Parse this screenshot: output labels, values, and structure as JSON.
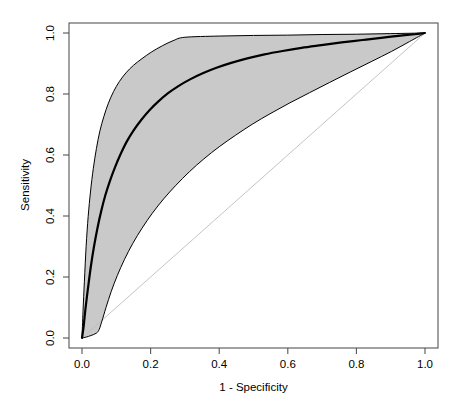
{
  "figure": {
    "kind": "roc-curve-plot",
    "width": 463,
    "height": 410,
    "background_color": "#ffffff"
  },
  "chart_data": {
    "type": "line",
    "title": "",
    "xlabel": "1 - Specificity",
    "ylabel": "Sensitivity",
    "xlim": [
      0.0,
      1.0
    ],
    "ylim": [
      0.0,
      1.0
    ],
    "grid": false,
    "legend": null,
    "xticks": [
      0.0,
      0.2,
      0.4,
      0.6,
      0.8,
      1.0
    ],
    "xtick_labels": [
      "0.0",
      "0.2",
      "0.4",
      "0.6",
      "0.8",
      "1.0"
    ],
    "yticks": [
      0.0,
      0.2,
      0.4,
      0.6,
      0.8,
      1.0
    ],
    "ytick_labels": [
      "0.0",
      "0.2",
      "0.4",
      "0.6",
      "0.8",
      "1.0"
    ],
    "series": [
      {
        "name": "mean-roc-curve",
        "style": "solid",
        "color": "#000000",
        "line_width": 2.2,
        "x": [
          0.0,
          0.005,
          0.01,
          0.018,
          0.026,
          0.035,
          0.045,
          0.056,
          0.068,
          0.082,
          0.097,
          0.113,
          0.13,
          0.15,
          0.172,
          0.196,
          0.222,
          0.25,
          0.281,
          0.315,
          0.352,
          0.392,
          0.435,
          0.482,
          0.532,
          0.585,
          0.64,
          0.698,
          0.757,
          0.818,
          0.878,
          0.935,
          0.97,
          1.0
        ],
        "y": [
          0.0,
          0.04,
          0.095,
          0.168,
          0.236,
          0.3,
          0.36,
          0.416,
          0.468,
          0.517,
          0.562,
          0.604,
          0.643,
          0.68,
          0.714,
          0.746,
          0.775,
          0.802,
          0.826,
          0.848,
          0.868,
          0.886,
          0.902,
          0.917,
          0.93,
          0.941,
          0.951,
          0.96,
          0.969,
          0.977,
          0.985,
          0.992,
          0.996,
          1.0
        ]
      },
      {
        "name": "upper-confidence-bound",
        "style": "solid",
        "color": "#000000",
        "line_width": 1.0,
        "x": [
          0.0,
          0.003,
          0.007,
          0.012,
          0.018,
          0.025,
          0.033,
          0.042,
          0.052,
          0.064,
          0.077,
          0.092,
          0.109,
          0.128,
          0.15,
          0.175,
          0.203,
          0.234,
          0.268,
          0.3,
          0.4,
          0.5,
          0.6,
          0.7,
          0.8,
          0.9,
          1.0
        ],
        "y": [
          0.0,
          0.088,
          0.186,
          0.3,
          0.398,
          0.482,
          0.556,
          0.621,
          0.678,
          0.727,
          0.77,
          0.808,
          0.841,
          0.869,
          0.894,
          0.916,
          0.938,
          0.958,
          0.976,
          0.986,
          0.99,
          0.992,
          0.993,
          0.995,
          0.996,
          0.998,
          1.0
        ]
      },
      {
        "name": "lower-confidence-bound",
        "style": "solid",
        "color": "#000000",
        "line_width": 1.0,
        "x": [
          0.0,
          0.012,
          0.026,
          0.042,
          0.05,
          0.058,
          0.07,
          0.085,
          0.103,
          0.124,
          0.148,
          0.175,
          0.205,
          0.238,
          0.274,
          0.313,
          0.355,
          0.4,
          0.448,
          0.498,
          0.551,
          0.606,
          0.663,
          0.722,
          0.782,
          0.843,
          0.903,
          0.955,
          1.0
        ],
        "y": [
          0.0,
          0.003,
          0.008,
          0.016,
          0.028,
          0.055,
          0.1,
          0.152,
          0.205,
          0.258,
          0.31,
          0.36,
          0.409,
          0.456,
          0.501,
          0.545,
          0.587,
          0.627,
          0.665,
          0.702,
          0.737,
          0.771,
          0.804,
          0.838,
          0.872,
          0.906,
          0.94,
          0.972,
          1.0
        ]
      },
      {
        "name": "chance-diagonal-reference-line",
        "style": "solid",
        "color": "#bdbdbd",
        "line_width": 0.9,
        "x": [
          0.0,
          1.0
        ],
        "y": [
          0.0,
          1.0
        ]
      }
    ],
    "confidence_band": {
      "name": "confidence-band-shading",
      "fill_color": "#c9c9c9",
      "between": [
        "lower-confidence-bound",
        "upper-confidence-bound"
      ]
    }
  },
  "axes": {
    "box_color": "#555555",
    "tick_color": "#555555",
    "x_title": "1 - Specificity",
    "y_title": "Sensitivity",
    "x_tick_labels": [
      "0.0",
      "0.2",
      "0.4",
      "0.6",
      "0.8",
      "1.0"
    ],
    "y_tick_labels": [
      "0.0",
      "0.2",
      "0.4",
      "0.6",
      "0.8",
      "1.0"
    ]
  }
}
